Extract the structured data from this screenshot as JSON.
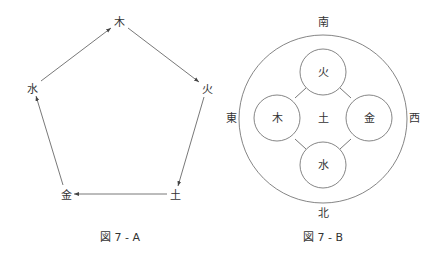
{
  "figure_a": {
    "caption": "図 7 - A",
    "nodes": [
      {
        "id": "wood",
        "label": "木",
        "x": 119,
        "y": 22
      },
      {
        "id": "fire",
        "label": "火",
        "x": 206,
        "y": 89
      },
      {
        "id": "earth",
        "label": "土",
        "x": 175,
        "y": 195
      },
      {
        "id": "metal",
        "label": "金",
        "x": 66,
        "y": 195
      },
      {
        "id": "water",
        "label": "水",
        "x": 33,
        "y": 89
      }
    ],
    "arrows": [
      {
        "from": "water",
        "to": "wood"
      },
      {
        "from": "wood",
        "to": "fire"
      },
      {
        "from": "fire",
        "to": "earth"
      },
      {
        "from": "earth",
        "to": "metal"
      },
      {
        "from": "metal",
        "to": "water"
      }
    ]
  },
  "figure_b": {
    "caption": "図 7 - B",
    "directions": {
      "south": "南",
      "north": "北",
      "east": "東",
      "west": "西"
    },
    "center_label": "土",
    "elements": {
      "top": "火",
      "left": "木",
      "right": "金",
      "bottom": "水"
    }
  }
}
